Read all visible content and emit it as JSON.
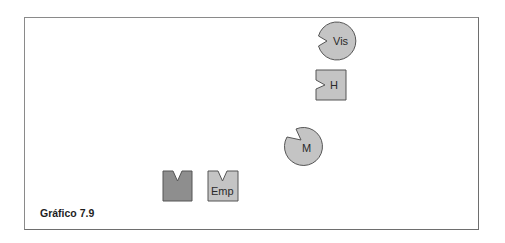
{
  "figure": {
    "caption": "Gráfico 7.9",
    "colors": {
      "frame": "#8a8a8a",
      "shape_fill_light": "#c4c4c4",
      "shape_fill_dark": "#8e8e8e",
      "shape_stroke": "#555555",
      "label": "#2a2a2a"
    },
    "shapes": [
      {
        "id": "vis",
        "type": "pie-circle",
        "label": "Vis",
        "notch": "left"
      },
      {
        "id": "h",
        "type": "notched-square",
        "label": "H",
        "notch": "left"
      },
      {
        "id": "m",
        "type": "pie-circle",
        "label": "M",
        "notch": "top-left"
      },
      {
        "id": "dark",
        "type": "notched-square",
        "label": "",
        "notch": "top"
      },
      {
        "id": "emp",
        "type": "notched-square",
        "label": "Emp",
        "notch": "top"
      }
    ]
  }
}
